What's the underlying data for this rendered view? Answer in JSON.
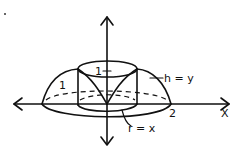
{
  "diagram": {
    "labels": {
      "cylinder_height": "1",
      "dome_height": "1",
      "height_label": "h = y",
      "radius_label": "r = x",
      "x_tick": "2",
      "x_axis": "X"
    },
    "colors": {
      "ink": "#111111",
      "background": "#ffffff"
    }
  }
}
